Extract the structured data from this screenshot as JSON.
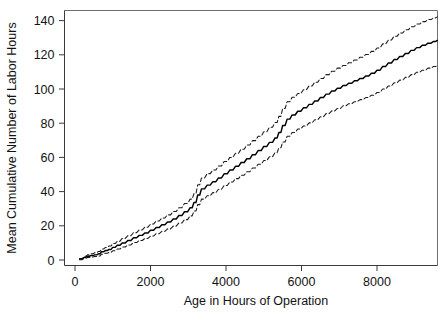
{
  "chart_data": {
    "type": "line",
    "title": "",
    "xlabel": "Age in Hours of Operation",
    "ylabel": "Mean Cumulative Number of Labor Hours",
    "xlim": [
      -200,
      9620
    ],
    "ylim": [
      -3,
      148
    ],
    "xticks": [
      0,
      2000,
      4000,
      6000,
      8000
    ],
    "xticklabels": [
      "0",
      "2000",
      "4000",
      "6000",
      "8000"
    ],
    "yticks": [
      0,
      20,
      40,
      60,
      80,
      100,
      120,
      140
    ],
    "yticklabels": [
      "0",
      "20",
      "40",
      "60",
      "80",
      "100",
      "120",
      "140"
    ],
    "grid": false,
    "legend": null,
    "frame": "box",
    "series": [
      {
        "name": "upper-confidence-limit",
        "style": "dashed",
        "color": "#1a1a1a",
        "x": [
          120,
          250,
          330,
          420,
          520,
          620,
          700,
          800,
          900,
          1000,
          1120,
          1250,
          1400,
          1550,
          1700,
          1850,
          2000,
          2150,
          2300,
          2450,
          2600,
          2750,
          2900,
          3050,
          3150,
          3250,
          3350,
          3500,
          3650,
          3800,
          3950,
          4100,
          4250,
          4400,
          4550,
          4700,
          4850,
          5000,
          5150,
          5300,
          5400,
          5500,
          5620,
          5750,
          5900,
          6050,
          6200,
          6350,
          6500,
          6650,
          6800,
          6950,
          7100,
          7250,
          7400,
          7550,
          7700,
          7850,
          8000,
          8150,
          8300,
          8450,
          8600,
          8750,
          8900,
          9050,
          9200,
          9350,
          9500,
          9600
        ],
        "y": [
          0.8,
          2.2,
          3.0,
          3.6,
          4.2,
          5.0,
          6.4,
          7.3,
          8.2,
          9.6,
          11.0,
          12.6,
          14.2,
          16.0,
          17.6,
          19.2,
          21.0,
          22.8,
          24.6,
          26.4,
          28.4,
          30.6,
          33.0,
          35.6,
          38.8,
          44.0,
          48.0,
          50.5,
          52.6,
          55.0,
          57.6,
          60.0,
          62.4,
          64.8,
          67.2,
          69.8,
          72.4,
          75.0,
          77.6,
          80.4,
          84.0,
          88.6,
          92.6,
          95.2,
          97.4,
          99.6,
          101.8,
          104.0,
          106.2,
          108.4,
          110.4,
          112.2,
          113.8,
          115.4,
          117.0,
          118.6,
          120.2,
          122.0,
          124.0,
          126.4,
          128.6,
          130.8,
          132.8,
          134.6,
          136.4,
          138.0,
          139.4,
          140.6,
          141.6,
          142.2
        ]
      },
      {
        "name": "mean-cumulative-function",
        "style": "solid",
        "color": "#000000",
        "x": [
          120,
          250,
          330,
          420,
          520,
          620,
          700,
          800,
          900,
          1000,
          1120,
          1250,
          1400,
          1550,
          1700,
          1850,
          2000,
          2150,
          2300,
          2450,
          2600,
          2750,
          2900,
          3050,
          3150,
          3250,
          3350,
          3500,
          3650,
          3800,
          3950,
          4100,
          4250,
          4400,
          4550,
          4700,
          4850,
          5000,
          5150,
          5300,
          5400,
          5500,
          5620,
          5750,
          5900,
          6050,
          6200,
          6350,
          6500,
          6650,
          6800,
          6950,
          7100,
          7250,
          7400,
          7550,
          7700,
          7850,
          8000,
          8150,
          8300,
          8450,
          8600,
          8750,
          8900,
          9050,
          9200,
          9350,
          9500,
          9600
        ],
        "y": [
          0.5,
          1.6,
          2.2,
          2.6,
          3.0,
          3.6,
          4.8,
          5.5,
          6.2,
          7.4,
          8.6,
          10.0,
          11.4,
          13.0,
          14.4,
          15.8,
          17.4,
          19.0,
          20.6,
          22.2,
          24.0,
          26.0,
          28.2,
          30.6,
          33.6,
          38.0,
          41.6,
          43.8,
          45.8,
          48.0,
          50.4,
          52.6,
          54.8,
          57.0,
          59.2,
          61.6,
          64.0,
          66.4,
          68.8,
          71.4,
          74.6,
          78.6,
          82.4,
          84.8,
          87.0,
          89.0,
          91.0,
          93.0,
          95.0,
          97.0,
          98.8,
          100.4,
          102.0,
          103.4,
          104.8,
          106.2,
          107.6,
          109.2,
          111.0,
          113.2,
          115.2,
          117.2,
          119.0,
          120.8,
          122.6,
          124.2,
          125.6,
          126.8,
          127.8,
          128.4
        ]
      },
      {
        "name": "lower-confidence-limit",
        "style": "dashed",
        "color": "#1a1a1a",
        "x": [
          120,
          250,
          330,
          420,
          520,
          620,
          700,
          800,
          900,
          1000,
          1120,
          1250,
          1400,
          1550,
          1700,
          1850,
          2000,
          2150,
          2300,
          2450,
          2600,
          2750,
          2900,
          3050,
          3150,
          3250,
          3350,
          3500,
          3650,
          3800,
          3950,
          4100,
          4250,
          4400,
          4550,
          4700,
          4850,
          5000,
          5150,
          5300,
          5400,
          5500,
          5620,
          5750,
          5900,
          6050,
          6200,
          6350,
          6500,
          6650,
          6800,
          6950,
          7100,
          7250,
          7400,
          7550,
          7700,
          7850,
          8000,
          8150,
          8300,
          8450,
          8600,
          8750,
          8900,
          9050,
          9200,
          9350,
          9500,
          9600
        ],
        "y": [
          0.2,
          1.0,
          1.5,
          1.8,
          2.0,
          2.4,
          3.4,
          3.9,
          4.4,
          5.4,
          6.4,
          7.6,
          8.8,
          10.2,
          11.4,
          12.6,
          14.0,
          15.4,
          16.8,
          18.2,
          19.8,
          21.6,
          23.6,
          25.8,
          28.6,
          32.4,
          35.6,
          37.6,
          39.4,
          41.4,
          43.6,
          45.6,
          47.6,
          49.6,
          51.6,
          53.8,
          56.0,
          58.2,
          60.4,
          62.8,
          65.6,
          69.0,
          72.4,
          74.6,
          76.6,
          78.4,
          80.2,
          82.0,
          83.8,
          85.6,
          87.2,
          88.6,
          90.2,
          91.4,
          92.6,
          93.8,
          95.0,
          96.4,
          98.0,
          100.0,
          101.8,
          103.6,
          105.2,
          106.8,
          108.4,
          109.8,
          111.0,
          112.2,
          113.2,
          113.8
        ]
      }
    ]
  }
}
